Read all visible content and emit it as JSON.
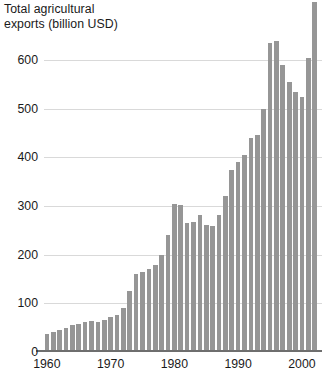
{
  "chart_data": {
    "type": "bar",
    "title": "Total agricultural\nexports (billion USD)",
    "xlabel": "",
    "ylabel": "Total agricultural exports (billion USD)",
    "ylim": [
      0,
      722
    ],
    "xlim": [
      1959.3,
      2003.5
    ],
    "grid": true,
    "legend": null,
    "y_ticks": [
      0,
      100,
      200,
      300,
      400,
      500,
      600
    ],
    "y_tick_labels": [
      "0",
      "100",
      "200",
      "300",
      "400",
      "500",
      "600"
    ],
    "x_ticks": [
      1960,
      1970,
      1980,
      1990,
      2000
    ],
    "x_tick_labels": [
      "1960",
      "1970",
      "1980",
      "1990",
      "2000"
    ],
    "bar_color": "#969696",
    "gridline_color": "#d9d9d9",
    "axis_color": "#6e6e6e",
    "note": "Final bar is clipped by the top edge of the figure.",
    "categories": [
      1960,
      1961,
      1962,
      1963,
      1964,
      1965,
      1966,
      1967,
      1968,
      1969,
      1970,
      1971,
      1972,
      1973,
      1974,
      1975,
      1976,
      1977,
      1978,
      1979,
      1980,
      1981,
      1982,
      1983,
      1984,
      1985,
      1986,
      1987,
      1988,
      1989,
      1990,
      1991,
      1992,
      1993,
      1994,
      1995,
      1996,
      1997,
      1998,
      1999,
      2000,
      2001,
      2002
    ],
    "values": [
      36,
      42,
      45,
      50,
      55,
      57,
      62,
      63,
      62,
      65,
      72,
      76,
      90,
      125,
      160,
      165,
      170,
      178,
      200,
      240,
      305,
      302,
      265,
      268,
      281,
      260,
      258,
      282,
      320,
      375,
      390,
      405,
      440,
      445,
      500,
      635,
      640,
      590,
      555,
      535,
      525,
      605,
      720
    ]
  }
}
